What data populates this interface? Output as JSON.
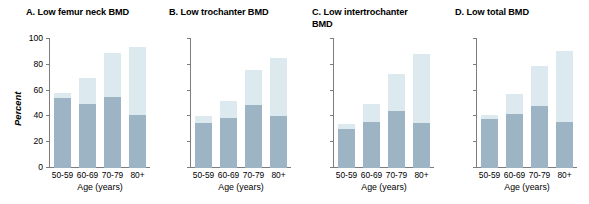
{
  "chart_data": {
    "type": "bar",
    "title": "",
    "xlabel": "Age (years)",
    "ylabel": "Percent",
    "ylim": [
      0,
      100
    ],
    "yticks": [
      0,
      20,
      40,
      60,
      80,
      100
    ],
    "grid": false,
    "legend": "none",
    "categories": [
      "50-59",
      "60-69",
      "70-79",
      "80+"
    ],
    "stacked": true,
    "colors": {
      "dark_segment": "#9cb4c3",
      "light_segment": "#dce9ef",
      "axis": "#7d7d7d",
      "text": "#000000"
    },
    "panels": [
      {
        "id": "A",
        "title": "A. Low femur neck BMD",
        "show_y_axis_labels": true,
        "show_y_axis_title": true,
        "series": [
          {
            "name": "dark",
            "values": [
              54,
              50,
              55,
              41
            ]
          },
          {
            "name": "total",
            "values": [
              58,
              70,
              89,
              94
            ]
          }
        ]
      },
      {
        "id": "B",
        "title": "B. Low trochanter BMD",
        "show_y_axis_labels": false,
        "show_y_axis_title": false,
        "series": [
          {
            "name": "dark",
            "values": [
              35,
              39,
              49,
              40
            ]
          },
          {
            "name": "total",
            "values": [
              40,
              52,
              76,
              85
            ]
          }
        ]
      },
      {
        "id": "C",
        "title": "C. Low intertrochanter\n    BMD",
        "show_y_axis_labels": false,
        "show_y_axis_title": false,
        "series": [
          {
            "name": "dark",
            "values": [
              30,
              36,
              44,
              35
            ]
          },
          {
            "name": "total",
            "values": [
              34,
              50,
              73,
              88
            ]
          }
        ]
      },
      {
        "id": "D",
        "title": "D. Low total BMD",
        "show_y_axis_labels": false,
        "show_y_axis_title": false,
        "series": [
          {
            "name": "dark",
            "values": [
              38,
              42,
              48,
              36
            ]
          },
          {
            "name": "total",
            "values": [
              41,
              57,
              79,
              91
            ]
          }
        ]
      }
    ]
  }
}
